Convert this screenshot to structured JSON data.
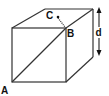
{
  "diagram": {
    "type": "cube",
    "labels": {
      "A": "A",
      "B": "B",
      "C": "C",
      "d": "d"
    },
    "colors": {
      "stroke": "#333333",
      "text": "#111111"
    }
  }
}
